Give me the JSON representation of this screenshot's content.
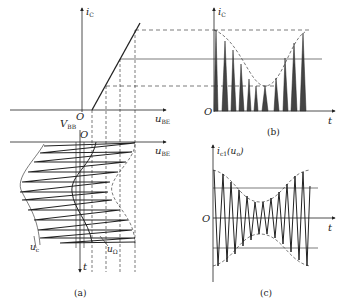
{
  "figure": {
    "panels": [
      {
        "id": "a",
        "caption": "(a)",
        "description": "Transfer characteristic iC vs uBE with input drive waveform (uΩ envelope and uc carrier) plotted along time axis"
      },
      {
        "id": "b",
        "caption": "(b)",
        "description": "Collector current iC pulse train vs t, amplitude modulated"
      },
      {
        "id": "c",
        "caption": "(c)",
        "description": "Fundamental component ic1 (uo) vs t showing AM waveform"
      }
    ],
    "labels": {
      "a_ic": "i",
      "a_ic_sub": "C",
      "a_ube": "u",
      "a_ube_sub": "BE",
      "a_vbb": "V",
      "a_vbb_sub": "BB",
      "a_origin": "O",
      "a_origin2": "O",
      "a_ube2": "u",
      "a_ube2_sub": "BE",
      "a_t": "t",
      "a_uc": "u",
      "a_uc_sub": "c",
      "a_uomega": "u",
      "a_uomega_sub": "Ω",
      "b_ic": "i",
      "b_ic_sub": "C",
      "b_origin": "O",
      "b_t": "t",
      "c_ic1": "i",
      "c_ic1_sub": "c1",
      "c_ic1_paren": "(u",
      "c_ic1_paren_sub": "o",
      "c_ic1_close": ")",
      "c_origin": "O",
      "c_t": "t"
    },
    "captions": {
      "a": "(a)",
      "b": "(b)",
      "c": "(c)"
    }
  }
}
